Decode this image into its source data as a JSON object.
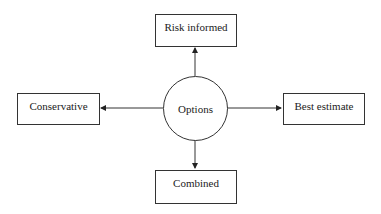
{
  "diagram": {
    "center": {
      "label": "Options"
    },
    "nodes": {
      "top": {
        "label": "Risk informed"
      },
      "left": {
        "label": "Conservative"
      },
      "right": {
        "label": "Best estimate"
      },
      "bottom": {
        "label": "Combined"
      }
    },
    "edges": [
      {
        "from": "Options",
        "to": "Risk informed"
      },
      {
        "from": "Options",
        "to": "Conservative"
      },
      {
        "from": "Options",
        "to": "Best estimate"
      },
      {
        "from": "Options",
        "to": "Combined"
      }
    ]
  }
}
